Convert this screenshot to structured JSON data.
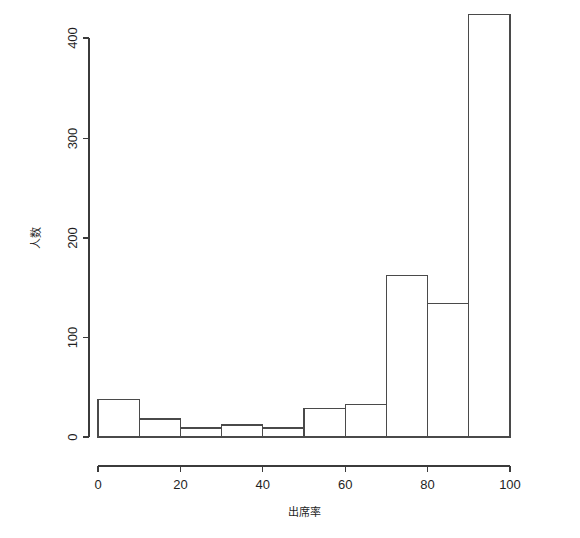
{
  "chart_data": {
    "type": "bar",
    "title": "",
    "subtitle": "",
    "xlabel": "出席率",
    "ylabel": "人数",
    "xlim": [
      0,
      100
    ],
    "ylim": [
      0,
      400
    ],
    "grid": false,
    "legend": null,
    "bin_width": 10,
    "categories": [
      "0-10",
      "10-20",
      "20-30",
      "30-40",
      "40-50",
      "50-60",
      "60-70",
      "70-80",
      "80-90",
      "90-100"
    ],
    "bin_edges": [
      0,
      10,
      20,
      30,
      40,
      50,
      60,
      70,
      80,
      90,
      100
    ],
    "values": [
      38,
      18,
      9,
      12,
      9,
      29,
      33,
      162,
      134,
      424
    ],
    "x_ticks": [
      0,
      20,
      40,
      60,
      80,
      100
    ],
    "x_tick_labels": [
      "0",
      "20",
      "40",
      "60",
      "80",
      "100"
    ],
    "y_ticks": [
      0,
      100,
      200,
      300,
      400
    ],
    "y_tick_labels": [
      "0",
      "100",
      "200",
      "300",
      "400"
    ],
    "bar_fill": "#ffffff",
    "bar_stroke": "#4a4a4a",
    "axis_color": "#3b3b3b",
    "background": "#ffffff"
  },
  "axes": {
    "y_title": "人数",
    "x_title": "出席率"
  },
  "y_labels": {
    "t0": "0",
    "t1": "100",
    "t2": "200",
    "t3": "300",
    "t4": "400"
  },
  "x_labels": {
    "t0": "0",
    "t1": "20",
    "t2": "40",
    "t3": "60",
    "t4": "80",
    "t5": "100"
  }
}
